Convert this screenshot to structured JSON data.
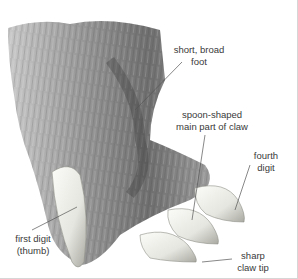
{
  "figure": {
    "colors": {
      "fur_dark": "#4a4a4a",
      "fur_mid": "#8a8a8a",
      "fur_light": "#c8c8c8",
      "claw": "#eeeeea",
      "claw_shadow": "#bdbdb6",
      "leader_line": "#555555",
      "label_text": "#3a3a3a"
    }
  },
  "labels": {
    "foot": {
      "line1": "short, broad",
      "line2": "foot"
    },
    "claw_main": {
      "line1": "spoon-shaped",
      "line2": "main part of claw"
    },
    "fourth_digit": {
      "line1": "fourth",
      "line2": "digit"
    },
    "first_digit": {
      "line1": "first digit",
      "line2": "(thumb)"
    },
    "claw_tip": {
      "line1": "sharp",
      "line2": "claw tip"
    }
  }
}
